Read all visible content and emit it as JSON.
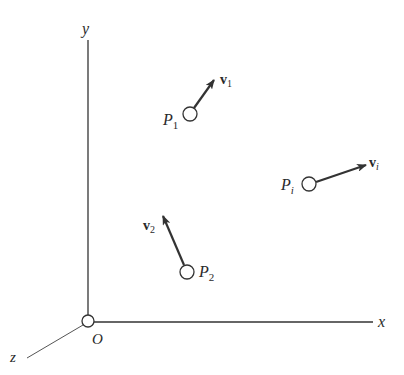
{
  "axes": {
    "x_label": "x",
    "y_label": "y",
    "z_label": "z",
    "origin_label": "O"
  },
  "particles": [
    {
      "name": "P",
      "sub": "1",
      "vel": "v",
      "vel_sub": "1"
    },
    {
      "name": "P",
      "sub": "2",
      "vel": "v",
      "vel_sub": "2"
    },
    {
      "name": "P",
      "sub": "i",
      "vel": "v",
      "vel_sub": "i"
    }
  ],
  "colors": {
    "line": "#333333",
    "background": "#ffffff"
  }
}
